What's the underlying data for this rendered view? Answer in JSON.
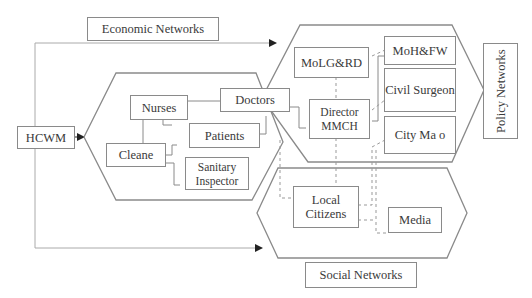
{
  "diagram": {
    "labels": {
      "economic": "Economic Networks",
      "policy": "Policy Networks",
      "social": "Social Networks"
    },
    "nodes": {
      "hcwm": "HCWM",
      "nurses": "Nurses",
      "doctors": "Doctors",
      "patients": "Patients",
      "cleane": "Cleane",
      "sanitary": "Sanitary Inspector",
      "molgrd": "MoLG&RD",
      "director": "Director MMCH",
      "mohfw": "MoH&FW",
      "civil": "Civil Surgeon",
      "city": "City Ma o",
      "local": "Local Citizens",
      "media": "Media"
    }
  }
}
